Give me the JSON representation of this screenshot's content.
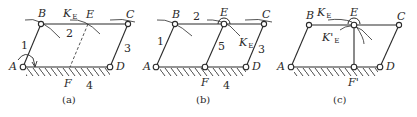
{
  "figure": {
    "panels": [
      {
        "id": "a",
        "caption": "(a)",
        "joints": {
          "A": "A",
          "B": "B",
          "C": "C",
          "D": "D",
          "E": "E",
          "F": "F"
        },
        "links": [
          "1",
          "2",
          "3",
          "4"
        ],
        "curve_label": {
          "main": "K",
          "sub": "E"
        }
      },
      {
        "id": "b",
        "caption": "(b)",
        "joints": {
          "A": "A",
          "B": "B",
          "C": "C",
          "D": "D",
          "E": "E",
          "F": "F"
        },
        "links": [
          "1",
          "2",
          "3",
          "4",
          "5"
        ],
        "curve_label": {
          "main": "K",
          "sub": "E"
        }
      },
      {
        "id": "c",
        "caption": "(c)",
        "joints": {
          "A": "A",
          "B": "B",
          "C": "C",
          "D": "D",
          "E": "E",
          "F": "F'"
        },
        "curve_label": {
          "main": "K",
          "sub": "E"
        },
        "curve_label2": {
          "main": "K'",
          "sub": "E"
        }
      }
    ]
  }
}
